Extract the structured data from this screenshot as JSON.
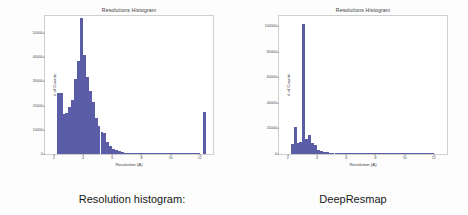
{
  "slide": {
    "background_color": "#fdfdfd",
    "bar_color": "#5b5ea6"
  },
  "panels": [
    {
      "id": "left",
      "caption": "Resolution histogram:",
      "chart": {
        "title": "Resolutions Histogram",
        "xlabel": "Resolution (A)",
        "ylabel": "# of Counts"
      }
    },
    {
      "id": "right",
      "caption": "DeepResmap",
      "chart": {
        "title": "Resolutions Histogram",
        "xlabel": "Resolution (A)",
        "ylabel": "# of Counts"
      }
    }
  ],
  "chart_data": [
    {
      "id": "resolution-histogram-original",
      "type": "bar",
      "title": "Resolutions Histogram",
      "xlabel": "Resolution (A)",
      "ylabel": "# of Counts",
      "xlim": [
        1.4,
        12.9
      ],
      "ylim": [
        0,
        57000
      ],
      "xticks": [
        2,
        4,
        6,
        8,
        10,
        12
      ],
      "yticks": [
        0,
        10000,
        20000,
        30000,
        40000,
        50000
      ],
      "ytick_labels": [
        "0",
        "10000",
        "20000",
        "30000",
        "40000",
        "50000"
      ],
      "grid": false,
      "legend": null,
      "bin_width": 0.2,
      "bins": [
        {
          "x": 2.3,
          "value": 25000
        },
        {
          "x": 2.5,
          "value": 25000
        },
        {
          "x": 2.7,
          "value": 16500
        },
        {
          "x": 2.9,
          "value": 16800
        },
        {
          "x": 3.1,
          "value": 19500
        },
        {
          "x": 3.3,
          "value": 22500
        },
        {
          "x": 3.5,
          "value": 31000
        },
        {
          "x": 3.7,
          "value": 38500
        },
        {
          "x": 3.9,
          "value": 56000
        },
        {
          "x": 4.1,
          "value": 41000
        },
        {
          "x": 4.3,
          "value": 32000
        },
        {
          "x": 4.5,
          "value": 26000
        },
        {
          "x": 4.7,
          "value": 21500
        },
        {
          "x": 4.9,
          "value": 15000
        },
        {
          "x": 5.1,
          "value": 11500
        },
        {
          "x": 5.3,
          "value": 9000
        },
        {
          "x": 5.5,
          "value": 8500
        },
        {
          "x": 5.7,
          "value": 5000
        },
        {
          "x": 5.9,
          "value": 3400
        },
        {
          "x": 6.1,
          "value": 2200
        },
        {
          "x": 6.3,
          "value": 1500
        },
        {
          "x": 6.5,
          "value": 1100
        },
        {
          "x": 6.7,
          "value": 800
        },
        {
          "x": 6.9,
          "value": 600
        },
        {
          "x": 7.1,
          "value": 450
        },
        {
          "x": 7.3,
          "value": 350
        },
        {
          "x": 7.5,
          "value": 280
        },
        {
          "x": 7.7,
          "value": 220
        },
        {
          "x": 7.9,
          "value": 180
        },
        {
          "x": 8.1,
          "value": 150
        },
        {
          "x": 8.3,
          "value": 120
        },
        {
          "x": 8.5,
          "value": 100
        },
        {
          "x": 8.7,
          "value": 90
        },
        {
          "x": 8.9,
          "value": 80
        },
        {
          "x": 9.1,
          "value": 70
        },
        {
          "x": 9.3,
          "value": 60
        },
        {
          "x": 9.5,
          "value": 55
        },
        {
          "x": 9.7,
          "value": 50
        },
        {
          "x": 9.9,
          "value": 45
        },
        {
          "x": 10.1,
          "value": 40
        },
        {
          "x": 10.3,
          "value": 38
        },
        {
          "x": 10.5,
          "value": 35
        },
        {
          "x": 10.7,
          "value": 32
        },
        {
          "x": 10.9,
          "value": 30
        },
        {
          "x": 11.1,
          "value": 28
        },
        {
          "x": 11.3,
          "value": 26
        },
        {
          "x": 11.5,
          "value": 24
        },
        {
          "x": 11.7,
          "value": 22
        },
        {
          "x": 11.9,
          "value": 20
        },
        {
          "x": 12.3,
          "value": 17500
        }
      ]
    },
    {
      "id": "resolution-histogram-deepresmap",
      "type": "bar",
      "title": "Resolutions Histogram",
      "xlabel": "Resolution (A)",
      "ylabel": "# of Counts",
      "xlim": [
        1.4,
        12.9
      ],
      "ylim": [
        0,
        108000
      ],
      "xticks": [
        2,
        4,
        6,
        8,
        10,
        12
      ],
      "yticks": [
        0,
        20000,
        40000,
        60000,
        80000,
        100000
      ],
      "ytick_labels": [
        "0",
        "20000",
        "40000",
        "60000",
        "80000",
        "100000"
      ],
      "grid": false,
      "legend": null,
      "bin_width": 0.2,
      "bins": [
        {
          "x": 2.3,
          "value": 8000
        },
        {
          "x": 2.5,
          "value": 21000
        },
        {
          "x": 2.7,
          "value": 9000
        },
        {
          "x": 2.9,
          "value": 9500
        },
        {
          "x": 3.1,
          "value": 102000
        },
        {
          "x": 3.3,
          "value": 12000
        },
        {
          "x": 3.5,
          "value": 14500
        },
        {
          "x": 3.7,
          "value": 9000
        },
        {
          "x": 3.9,
          "value": 7000
        },
        {
          "x": 4.1,
          "value": 3500
        },
        {
          "x": 4.3,
          "value": 2200
        },
        {
          "x": 4.5,
          "value": 1600
        },
        {
          "x": 4.7,
          "value": 1200
        },
        {
          "x": 4.9,
          "value": 950
        },
        {
          "x": 5.1,
          "value": 800
        },
        {
          "x": 5.3,
          "value": 650
        },
        {
          "x": 5.5,
          "value": 520
        },
        {
          "x": 5.7,
          "value": 430
        },
        {
          "x": 5.9,
          "value": 360
        },
        {
          "x": 6.1,
          "value": 300
        },
        {
          "x": 6.3,
          "value": 250
        },
        {
          "x": 6.5,
          "value": 210
        },
        {
          "x": 6.7,
          "value": 180
        },
        {
          "x": 6.9,
          "value": 150
        },
        {
          "x": 7.1,
          "value": 130
        },
        {
          "x": 7.3,
          "value": 110
        },
        {
          "x": 7.5,
          "value": 95
        },
        {
          "x": 7.7,
          "value": 85
        },
        {
          "x": 7.9,
          "value": 75
        },
        {
          "x": 8.1,
          "value": 65
        },
        {
          "x": 8.3,
          "value": 58
        },
        {
          "x": 8.5,
          "value": 52
        },
        {
          "x": 8.7,
          "value": 46
        },
        {
          "x": 8.9,
          "value": 42
        },
        {
          "x": 9.1,
          "value": 38
        },
        {
          "x": 9.3,
          "value": 34
        },
        {
          "x": 9.5,
          "value": 30
        },
        {
          "x": 9.7,
          "value": 28
        },
        {
          "x": 9.9,
          "value": 25
        },
        {
          "x": 10.1,
          "value": 23
        },
        {
          "x": 10.3,
          "value": 21
        },
        {
          "x": 10.5,
          "value": 19
        },
        {
          "x": 10.7,
          "value": 18
        },
        {
          "x": 10.9,
          "value": 16
        },
        {
          "x": 11.1,
          "value": 15
        },
        {
          "x": 11.3,
          "value": 14
        },
        {
          "x": 11.5,
          "value": 13
        },
        {
          "x": 11.7,
          "value": 12
        },
        {
          "x": 11.9,
          "value": 11
        }
      ]
    }
  ]
}
